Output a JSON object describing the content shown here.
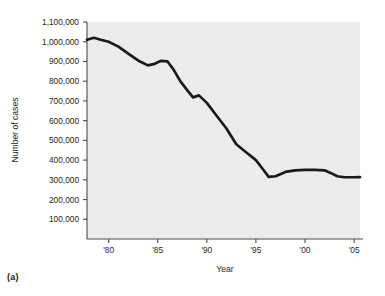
{
  "figure": {
    "panel_caption": "(a)"
  },
  "chart_data": {
    "type": "line",
    "title": "",
    "xlabel": "Year",
    "ylabel": "Number of cases",
    "xlim": [
      1977.8,
      2005.6
    ],
    "ylim": [
      0,
      1100000
    ],
    "grid": false,
    "legend": null,
    "x_tick_values": [
      1980,
      1985,
      1990,
      1995,
      2000,
      2005
    ],
    "x_tick_labels": [
      "'80",
      "'85",
      "'90",
      "'95",
      "'00",
      "'05"
    ],
    "y_tick_values": [
      100000,
      200000,
      300000,
      400000,
      500000,
      600000,
      700000,
      800000,
      900000,
      1000000,
      1100000
    ],
    "y_tick_labels": [
      "100,000",
      "200,000",
      "300,000",
      "400,000",
      "500,000",
      "600,000",
      "700,000",
      "800,000",
      "900,000",
      "1,000,000",
      "1,100,000"
    ],
    "series": [
      {
        "name": "Number of cases",
        "x": [
          1977.8,
          1978.5,
          1979.2,
          1980.0,
          1981.0,
          1982.0,
          1983.0,
          1984.0,
          1984.7,
          1985.3,
          1986.0,
          1986.6,
          1987.3,
          1988.0,
          1988.6,
          1989.2,
          1990.0,
          1991.0,
          1992.0,
          1993.0,
          1994.0,
          1995.0,
          1995.7,
          1996.3,
          1997.0,
          1998.0,
          1999.0,
          2000.0,
          2001.0,
          2002.0,
          2002.6,
          2003.3,
          2004.0,
          2005.0,
          2005.6
        ],
        "y": [
          1010000,
          1020000,
          1010000,
          1000000,
          975000,
          940000,
          905000,
          880000,
          888000,
          903000,
          900000,
          860000,
          800000,
          755000,
          718000,
          728000,
          690000,
          625000,
          560000,
          480000,
          440000,
          400000,
          355000,
          315000,
          318000,
          340000,
          348000,
          350000,
          350000,
          348000,
          335000,
          318000,
          313000,
          313000,
          314000
        ]
      }
    ]
  }
}
